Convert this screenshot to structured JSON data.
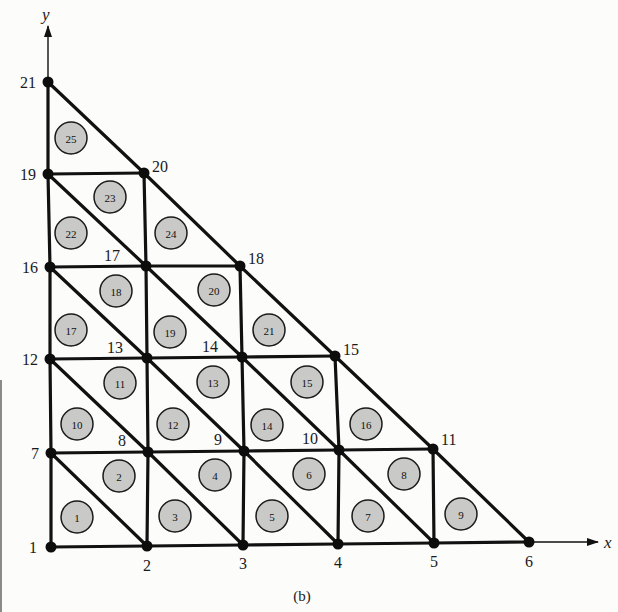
{
  "figure": {
    "caption": "(b)",
    "axes": {
      "x_label": "x",
      "y_label": "y"
    },
    "nodes": [
      {
        "id": "1",
        "label": "1",
        "x": 51,
        "y": 547,
        "label_dx": -22,
        "label_dy": 6
      },
      {
        "id": "2",
        "label": "2",
        "x": 147,
        "y": 546,
        "label_dx": -4,
        "label_dy": 25
      },
      {
        "id": "3",
        "label": "3",
        "x": 243,
        "y": 545,
        "label_dx": -4,
        "label_dy": 24
      },
      {
        "id": "4",
        "label": "4",
        "x": 338,
        "y": 544,
        "label_dx": -4,
        "label_dy": 24
      },
      {
        "id": "5",
        "label": "5",
        "x": 434,
        "y": 543,
        "label_dx": -4,
        "label_dy": 24
      },
      {
        "id": "6",
        "label": "6",
        "x": 529,
        "y": 542,
        "label_dx": -4,
        "label_dy": 25
      },
      {
        "id": "7",
        "label": "7",
        "x": 51,
        "y": 453,
        "label_dx": -20,
        "label_dy": 6
      },
      {
        "id": "8",
        "label": "8",
        "x": 148,
        "y": 452,
        "label_dx": -30,
        "label_dy": -6
      },
      {
        "id": "9",
        "label": "9",
        "x": 244,
        "y": 451,
        "label_dx": -30,
        "label_dy": -6
      },
      {
        "id": "10",
        "label": "10",
        "x": 339,
        "y": 450,
        "label_dx": -37,
        "label_dy": -6
      },
      {
        "id": "11",
        "label": "11",
        "x": 433,
        "y": 449,
        "label_dx": 8,
        "label_dy": -4
      },
      {
        "id": "12",
        "label": "12",
        "x": 50,
        "y": 359,
        "label_dx": -28,
        "label_dy": 6
      },
      {
        "id": "13",
        "label": "13",
        "x": 147,
        "y": 358,
        "label_dx": -40,
        "label_dy": -5
      },
      {
        "id": "14",
        "label": "14",
        "x": 242,
        "y": 357,
        "label_dx": -40,
        "label_dy": -5
      },
      {
        "id": "15",
        "label": "15",
        "x": 335,
        "y": 356,
        "label_dx": 8,
        "label_dy": -1
      },
      {
        "id": "16",
        "label": "16",
        "x": 50,
        "y": 267,
        "label_dx": -28,
        "label_dy": 6
      },
      {
        "id": "17",
        "label": "17",
        "x": 146,
        "y": 266,
        "label_dx": -42,
        "label_dy": -5
      },
      {
        "id": "18",
        "label": "18",
        "x": 240,
        "y": 266,
        "label_dx": 8,
        "label_dy": -2
      },
      {
        "id": "19",
        "label": "19",
        "x": 48,
        "y": 174,
        "label_dx": -28,
        "label_dy": 6
      },
      {
        "id": "20",
        "label": "20",
        "x": 144,
        "y": 173,
        "label_dx": 8,
        "label_dy": -1
      },
      {
        "id": "21",
        "label": "21",
        "x": 48,
        "y": 82,
        "label_dx": -28,
        "label_dy": 6
      }
    ],
    "edges": [
      [
        "1",
        "2"
      ],
      [
        "2",
        "3"
      ],
      [
        "3",
        "4"
      ],
      [
        "4",
        "5"
      ],
      [
        "5",
        "6"
      ],
      [
        "7",
        "8"
      ],
      [
        "8",
        "9"
      ],
      [
        "9",
        "10"
      ],
      [
        "10",
        "11"
      ],
      [
        "12",
        "13"
      ],
      [
        "13",
        "14"
      ],
      [
        "14",
        "15"
      ],
      [
        "16",
        "17"
      ],
      [
        "17",
        "18"
      ],
      [
        "19",
        "20"
      ],
      [
        "1",
        "7"
      ],
      [
        "7",
        "12"
      ],
      [
        "12",
        "16"
      ],
      [
        "16",
        "19"
      ],
      [
        "19",
        "21"
      ],
      [
        "2",
        "8"
      ],
      [
        "8",
        "13"
      ],
      [
        "13",
        "17"
      ],
      [
        "17",
        "20"
      ],
      [
        "3",
        "9"
      ],
      [
        "9",
        "14"
      ],
      [
        "14",
        "18"
      ],
      [
        "4",
        "10"
      ],
      [
        "10",
        "15"
      ],
      [
        "5",
        "11"
      ],
      [
        "21",
        "20"
      ],
      [
        "20",
        "18"
      ],
      [
        "18",
        "15"
      ],
      [
        "15",
        "11"
      ],
      [
        "11",
        "6"
      ],
      [
        "7",
        "2"
      ],
      [
        "8",
        "3"
      ],
      [
        "9",
        "4"
      ],
      [
        "10",
        "5"
      ],
      [
        "12",
        "8"
      ],
      [
        "13",
        "9"
      ],
      [
        "14",
        "10"
      ],
      [
        "16",
        "13"
      ],
      [
        "17",
        "14"
      ],
      [
        "19",
        "17"
      ]
    ],
    "elements": [
      {
        "label": "1",
        "x": 77,
        "y": 517
      },
      {
        "label": "2",
        "x": 119,
        "y": 476
      },
      {
        "label": "3",
        "x": 175,
        "y": 516
      },
      {
        "label": "4",
        "x": 215,
        "y": 475
      },
      {
        "label": "5",
        "x": 272,
        "y": 516
      },
      {
        "label": "6",
        "x": 309,
        "y": 474
      },
      {
        "label": "7",
        "x": 368,
        "y": 516
      },
      {
        "label": "8",
        "x": 404,
        "y": 474
      },
      {
        "label": "9",
        "x": 461,
        "y": 514
      },
      {
        "label": "10",
        "x": 77,
        "y": 424
      },
      {
        "label": "11",
        "x": 120,
        "y": 383
      },
      {
        "label": "12",
        "x": 173,
        "y": 424
      },
      {
        "label": "13",
        "x": 213,
        "y": 382
      },
      {
        "label": "14",
        "x": 267,
        "y": 425
      },
      {
        "label": "15",
        "x": 307,
        "y": 382
      },
      {
        "label": "16",
        "x": 366,
        "y": 424
      },
      {
        "label": "17",
        "x": 71,
        "y": 330
      },
      {
        "label": "18",
        "x": 116,
        "y": 291
      },
      {
        "label": "19",
        "x": 170,
        "y": 332
      },
      {
        "label": "20",
        "x": 214,
        "y": 290
      },
      {
        "label": "21",
        "x": 269,
        "y": 330
      },
      {
        "label": "22",
        "x": 71,
        "y": 233
      },
      {
        "label": "23",
        "x": 110,
        "y": 197
      },
      {
        "label": "24",
        "x": 171,
        "y": 233
      },
      {
        "label": "25",
        "x": 71,
        "y": 138
      }
    ]
  }
}
